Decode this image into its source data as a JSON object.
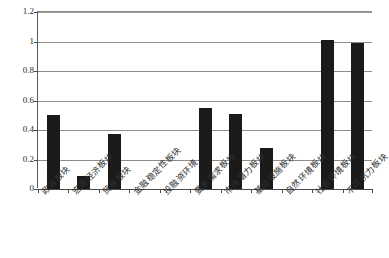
{
  "chart_data": {
    "type": "bar",
    "title": "",
    "xlabel": "",
    "ylabel": "",
    "ylim": [
      0,
      1.2
    ],
    "ytick_values": [
      0,
      0.2,
      0.4,
      0.6,
      0.8,
      1,
      1.2
    ],
    "ytick_labels": [
      "0",
      "0.2",
      "0.4",
      "0.6",
      "0.8",
      "1",
      "1.2"
    ],
    "grid": true,
    "legend": false,
    "legend_position": "none",
    "bar_color": "#1a1a1a",
    "background_color": "#ffffff",
    "axis_color": "#4a4a4a",
    "gridline_color": "#8d8d8d",
    "xlabel_rotation_deg": -45,
    "categories": [
      "政治板块",
      "宏观经济板块",
      "贸易板块",
      "金融稳定性板块",
      "投融资环境",
      "要素需求板块",
      "市场潜力板块",
      "基础设施板块",
      "自然环境板块",
      "社会环境板块",
      "不可抗力板块"
    ],
    "values": [
      0.5,
      0.09,
      0.375,
      0,
      0,
      0.55,
      0.51,
      0.28,
      0,
      1.01,
      0.99
    ]
  }
}
